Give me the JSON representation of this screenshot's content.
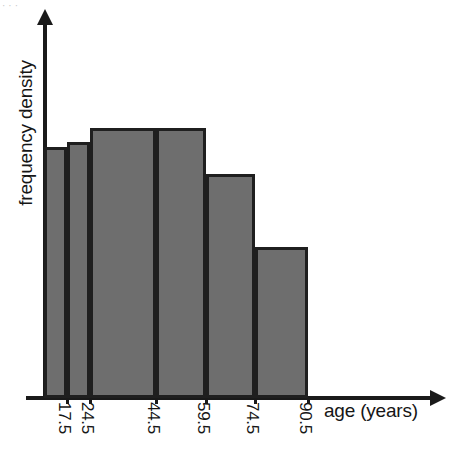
{
  "chart_data": {
    "type": "bar",
    "title": "",
    "subtitle": "",
    "xlabel": "age (years)",
    "ylabel": "frequency density",
    "grid": false,
    "legend": null,
    "legend_position": "none",
    "axis_style": "arrow-ended axes, no numeric y-scale",
    "x_tick_labels": [
      "17.5",
      "24.5",
      "44.5",
      "59.5",
      "74.5",
      "90.5"
    ],
    "x_tick_rotation_deg": 90,
    "y_tick_labels": [],
    "xlim": [
      10.5,
      90.5
    ],
    "ylim": [
      0,
      1.25
    ],
    "bin_edges": [
      10.5,
      17.5,
      24.5,
      44.5,
      59.5,
      74.5,
      90.5
    ],
    "categories": [
      "10.5-17.5",
      "17.5-24.5",
      "24.5-44.5",
      "44.5-59.5",
      "59.5-74.5",
      "74.5-90.5"
    ],
    "values": [
      0.93,
      0.95,
      1.0,
      1.0,
      0.83,
      0.56
    ],
    "bars": [
      {
        "label": "10.5-17.5",
        "x_start": "10.5",
        "x_end": "17.5",
        "value": 0.93
      },
      {
        "label": "17.5-24.5",
        "x_start": "17.5",
        "x_end": "24.5",
        "value": 0.95
      },
      {
        "label": "24.5-44.5",
        "x_start": "24.5",
        "x_end": "44.5",
        "value": 1.0
      },
      {
        "label": "44.5-59.5",
        "x_start": "44.5",
        "x_end": "59.5",
        "value": 1.0
      },
      {
        "label": "59.5-74.5",
        "x_start": "59.5",
        "x_end": "74.5",
        "value": 0.83
      },
      {
        "label": "74.5-90.5",
        "x_start": "74.5",
        "x_end": "90.5",
        "value": 0.56
      }
    ],
    "colors": {
      "bar_fill": "#6e6e6e",
      "bar_stroke": "#1f1f1f",
      "axis": "#1a1a1a",
      "text": "#161616",
      "background": "#ffffff"
    }
  },
  "artifacts": {
    "top_edge_fragment": "···"
  }
}
